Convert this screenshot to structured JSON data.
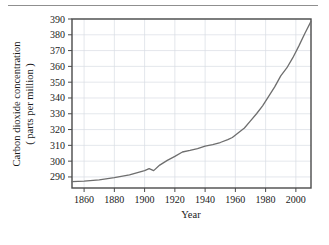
{
  "figure": {
    "rule_color": "#8f8f8f",
    "background": "#ffffff"
  },
  "chart_data": {
    "type": "line",
    "title": "",
    "xlabel": "Year",
    "ylabel_line1": "Carbon dioxide concentration",
    "ylabel_line2": "( parts per million )",
    "xlim": [
      1852,
      2010
    ],
    "ylim": [
      283,
      390
    ],
    "xticks": [
      1860,
      1880,
      1900,
      1920,
      1940,
      1960,
      1980,
      2000
    ],
    "yticks": [
      290,
      300,
      310,
      320,
      330,
      340,
      350,
      360,
      370,
      380,
      390
    ],
    "grid": true,
    "grid_color": "#d8dce4",
    "line_color": "#6e6e6e",
    "legend": "none",
    "series": [
      {
        "name": "Atmospheric CO2 concentration",
        "x": [
          1852,
          1860,
          1870,
          1880,
          1890,
          1900,
          1903,
          1906,
          1910,
          1915,
          1920,
          1925,
          1930,
          1935,
          1940,
          1945,
          1950,
          1955,
          1958,
          1962,
          1966,
          1970,
          1974,
          1978,
          1982,
          1986,
          1990,
          1994,
          1998,
          2002,
          2006,
          2010
        ],
        "values": [
          287.0,
          287.3,
          288.2,
          289.5,
          291.3,
          294.0,
          295.3,
          294.0,
          297.5,
          300.5,
          303.0,
          305.8,
          306.8,
          308.0,
          309.5,
          310.5,
          311.8,
          313.6,
          315.0,
          318.0,
          321.0,
          325.5,
          330.0,
          335.0,
          341.0,
          347.0,
          354.0,
          359.0,
          365.5,
          373.0,
          381.0,
          388.5
        ]
      }
    ]
  }
}
